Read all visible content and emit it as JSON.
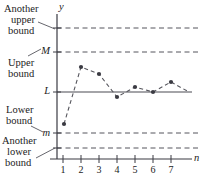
{
  "figure": {
    "axes": {
      "y_axis_label": "y",
      "x_axis_label": "n"
    },
    "value_labels": [
      {
        "text": "M",
        "y": 52
      },
      {
        "text": "L",
        "y": 92
      },
      {
        "text": "m",
        "y": 133
      }
    ],
    "annotations": [
      {
        "name": "another-upper-bound",
        "lines": [
          "Another",
          "upper",
          "bound"
        ],
        "x": 4,
        "y": 4,
        "target_y": 28
      },
      {
        "name": "upper-bound",
        "lines": [
          "Upper",
          "bound"
        ],
        "x": 10,
        "y": 58,
        "target_y": 52
      },
      {
        "name": "lower-bound",
        "lines": [
          "Lower",
          "bound"
        ],
        "x": 8,
        "y": 105,
        "target_y": 133
      },
      {
        "name": "another-lower-bound",
        "lines": [
          "Another",
          "lower",
          "bound"
        ],
        "x": 2,
        "y": 136,
        "target_y": 148
      }
    ],
    "tick_labels": [
      "1",
      "2",
      "3",
      "4",
      "5",
      "6",
      "7"
    ],
    "colors": {
      "ink": "#1b1b1b",
      "line": "#4a4a52",
      "marker": "#3a3a42",
      "dashed": "#55555c",
      "solid_limit": "#4a4a52"
    }
  },
  "chart_data": {
    "type": "scatter",
    "title": "",
    "xlabel": "n",
    "ylabel": "y",
    "grid": false,
    "legend": "none",
    "x": [
      1,
      2,
      3,
      4,
      5,
      6,
      7,
      8
    ],
    "categories": [
      "1",
      "2",
      "3",
      "4",
      "5",
      "6",
      "7",
      ""
    ],
    "series": [
      {
        "name": "a_n",
        "style": "dashed-with-markers",
        "px": [
          {
            "x": 64,
            "y": 124
          },
          {
            "x": 81,
            "y": 67
          },
          {
            "x": 99,
            "y": 74
          },
          {
            "x": 117,
            "y": 97
          },
          {
            "x": 135,
            "y": 87
          },
          {
            "x": 153,
            "y": 92
          },
          {
            "x": 171,
            "y": 82
          },
          {
            "x": 189,
            "y": 92
          }
        ]
      }
    ],
    "reference_lines": [
      {
        "name": "another-upper-bound-line",
        "label": "",
        "style": "dashed",
        "y_px": 28
      },
      {
        "name": "M-line",
        "label": "M",
        "style": "dashed",
        "y_px": 52
      },
      {
        "name": "L-line",
        "label": "L",
        "style": "solid",
        "y_px": 92
      },
      {
        "name": "m-line",
        "label": "m",
        "style": "dashed",
        "y_px": 133
      },
      {
        "name": "another-lower-bound-line",
        "label": "",
        "style": "dashed",
        "y_px": 148
      }
    ],
    "axis_px": {
      "x_axis_y": 159,
      "y_axis_x": 57,
      "x_min_px": 57,
      "x_max_px": 198,
      "tick_x": [
        63,
        81,
        99,
        117,
        135,
        153,
        171
      ]
    }
  }
}
